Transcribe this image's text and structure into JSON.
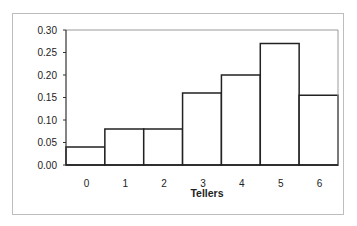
{
  "chart_data": {
    "type": "bar",
    "title": "",
    "xlabel": "Tellers",
    "ylabel": "",
    "categories": [
      "0",
      "1",
      "2",
      "3",
      "4",
      "5",
      "6"
    ],
    "values": [
      0.04,
      0.08,
      0.08,
      0.16,
      0.2,
      0.27,
      0.155
    ],
    "ylim": [
      0,
      0.3
    ],
    "yticks": [
      "0.00",
      "0.05",
      "0.10",
      "0.15",
      "0.20",
      "0.25",
      "0.30"
    ],
    "grid": false,
    "legend": null,
    "bar_style": {
      "fill": "#ffffff",
      "edge": "#222222",
      "gap": 0
    }
  }
}
